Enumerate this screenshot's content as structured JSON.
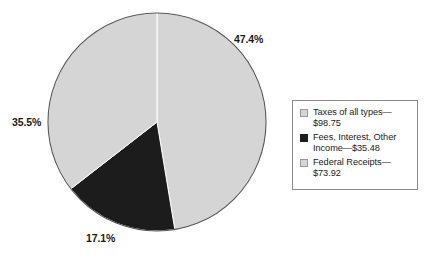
{
  "chart_data": {
    "type": "pie",
    "title": "",
    "subtitle": "",
    "xlabel": "",
    "ylabel": "",
    "grid": false,
    "legend_position": "right",
    "start_angle_deg": 0,
    "direction": "clockwise",
    "center": {
      "x": 157,
      "y": 122
    },
    "radius": 109,
    "stroke_color": "#555555",
    "separator_color": "#ffffff",
    "categories": [
      "Taxes of all types",
      "Fees, Interest, Other Income",
      "Federal Receipts"
    ],
    "values": [
      98.75,
      35.48,
      73.92
    ],
    "percentages": [
      47.4,
      17.1,
      35.5
    ],
    "pct_labels": [
      "47.4%",
      "17.1%",
      "35.5%"
    ],
    "slice_colors": [
      "#d5d5d5",
      "#1c1c1c",
      "#d5d5d5"
    ],
    "slices": [
      {
        "name": "Taxes of all types",
        "value": 98.75,
        "percent": 47.4,
        "pct_label": "47.4%",
        "color": "#d5d5d5",
        "start_deg": 0.0,
        "end_deg": 170.6
      },
      {
        "name": "Fees, Interest, Other Income",
        "value": 35.48,
        "percent": 17.1,
        "pct_label": "17.1%",
        "color": "#1c1c1c",
        "start_deg": 170.6,
        "end_deg": 232.2
      },
      {
        "name": "Federal Receipts",
        "value": 73.92,
        "percent": 35.5,
        "pct_label": "35.5%",
        "color": "#d5d5d5",
        "start_deg": 232.2,
        "end_deg": 360.0
      }
    ],
    "legend_entries": [
      {
        "label": "Taxes of all types—$98.75",
        "color": "#d5d5d5"
      },
      {
        "label": "Fees, Interest, Other Income—$35.48",
        "color": "#1c1c1c"
      },
      {
        "label": "Federal Receipts—$73.92",
        "color": "#d5d5d5"
      }
    ]
  },
  "labels": {
    "taxes_pct": "47.4%",
    "fees_pct": "17.1%",
    "federal_pct": "35.5%"
  },
  "legend": {
    "items": [
      {
        "line1": "Taxes of all types—",
        "line2": "$98.75",
        "color": "#d5d5d5"
      },
      {
        "line1": "Fees, Interest, Other",
        "line2": "Income—$35.48",
        "color": "#1c1c1c"
      },
      {
        "line1": "Federal Receipts—",
        "line2": "$73.92",
        "color": "#d5d5d5"
      }
    ]
  }
}
